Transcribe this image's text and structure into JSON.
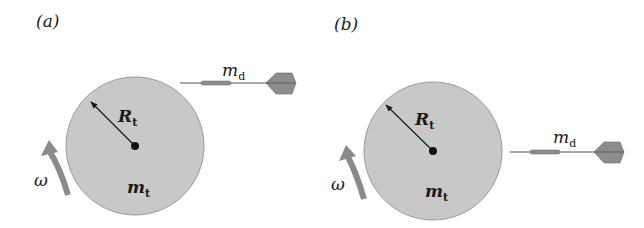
{
  "figure": {
    "panels": [
      {
        "id": "a",
        "label": "(a)",
        "target": {
          "radius_label": "R",
          "radius_sub": "t",
          "mass_label": "m",
          "mass_sub": "t",
          "center": [
            135,
            146
          ],
          "radius": 69,
          "fill": "#c8c8c8"
        },
        "rotation": {
          "label": "ω",
          "direction": "counterclockwise"
        },
        "dart": {
          "label": "m",
          "label_sub": "d",
          "position": "above-right, approaching",
          "y": 84
        }
      },
      {
        "id": "b",
        "label": "(b)",
        "target": {
          "radius_label": "R",
          "radius_sub": "t",
          "mass_label": "m",
          "mass_sub": "t",
          "center": [
            433,
            151
          ],
          "radius": 69,
          "fill": "#c8c8c8"
        },
        "rotation": {
          "label": "ω",
          "direction": "counterclockwise"
        },
        "dart": {
          "label": "m",
          "label_sub": "d",
          "position": "right, level with center",
          "y": 153
        }
      }
    ],
    "colors": {
      "disk_fill": "#c8c8c8",
      "disk_stroke": "#9a9a9a",
      "arrow_gray": "#8a8a8a",
      "dart_gray": "#8c8c8c",
      "ink": "#1a1a1a"
    }
  }
}
